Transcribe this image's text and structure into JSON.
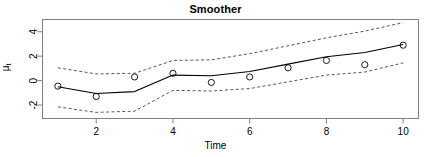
{
  "chart_data": {
    "type": "line",
    "title": "Smoother",
    "xlabel": "Time",
    "ylabel_mu": "μ",
    "ylabel_sub": "t",
    "x": [
      1,
      2,
      3,
      4,
      5,
      6,
      7,
      8,
      9,
      10
    ],
    "xlim": [
      0.6,
      10.4
    ],
    "ylim": [
      -3.1,
      5.0
    ],
    "xticks": [
      2,
      4,
      6,
      8,
      10
    ],
    "xtick_labels": [
      "2",
      "4",
      "6",
      "8",
      "10"
    ],
    "yticks": [
      -2,
      0,
      2,
      4
    ],
    "ytick_labels": [
      "-2",
      "0",
      "2",
      "4"
    ],
    "grid": false,
    "legend": null,
    "series": [
      {
        "name": "observations",
        "style": "points",
        "marker": "open-circle",
        "values": [
          -0.45,
          -1.3,
          0.3,
          0.6,
          -0.15,
          0.3,
          1.05,
          1.65,
          1.3,
          2.9
        ]
      },
      {
        "name": "smoother",
        "style": "solid-line",
        "values": [
          -0.5,
          -1.05,
          -0.9,
          0.45,
          0.4,
          0.75,
          1.35,
          1.95,
          2.3,
          2.95
        ]
      },
      {
        "name": "upper-confidence-band",
        "style": "dashed-line",
        "values": [
          1.05,
          0.55,
          0.6,
          1.65,
          1.7,
          2.2,
          2.85,
          3.5,
          4.05,
          4.75
        ]
      },
      {
        "name": "lower-confidence-band",
        "style": "dashed-line",
        "values": [
          -2.15,
          -2.6,
          -2.5,
          -0.8,
          -0.85,
          -0.65,
          -0.1,
          0.45,
          0.7,
          1.45
        ]
      }
    ],
    "colors": {
      "line": "#000000",
      "band": "#444444",
      "marker": "#000000",
      "frame": "#808080",
      "background": "#ffffff"
    }
  }
}
